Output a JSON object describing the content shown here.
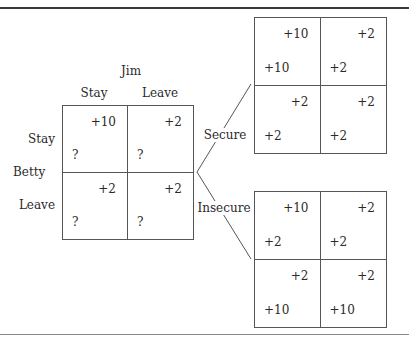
{
  "diagram": {
    "type": "game-matrix-branching",
    "base_game": {
      "column_player": "Jim",
      "row_player": "Betty",
      "column_strategies": [
        "Stay",
        "Leave"
      ],
      "row_strategies": [
        "Stay",
        "Leave"
      ],
      "cells": [
        [
          {
            "col_payoff": "+10",
            "row_payoff": "?"
          },
          {
            "col_payoff": "+2",
            "row_payoff": "?"
          }
        ],
        [
          {
            "col_payoff": "+2",
            "row_payoff": "?"
          },
          {
            "col_payoff": "+2",
            "row_payoff": "?"
          }
        ]
      ]
    },
    "branches": [
      {
        "label": "Secure",
        "cells": [
          [
            {
              "col_payoff": "+10",
              "row_payoff": "+10"
            },
            {
              "col_payoff": "+2",
              "row_payoff": "+2"
            }
          ],
          [
            {
              "col_payoff": "+2",
              "row_payoff": "+2"
            },
            {
              "col_payoff": "+2",
              "row_payoff": "+2"
            }
          ]
        ]
      },
      {
        "label": "Insecure",
        "cells": [
          [
            {
              "col_payoff": "+10",
              "row_payoff": "+2"
            },
            {
              "col_payoff": "+2",
              "row_payoff": "+2"
            }
          ],
          [
            {
              "col_payoff": "+2",
              "row_payoff": "+10"
            },
            {
              "col_payoff": "+2",
              "row_payoff": "+10"
            }
          ]
        ]
      }
    ],
    "colors": {
      "line": "#555555",
      "text": "#2a2a2a",
      "rule_top": "#3a3a3a",
      "rule_bottom": "#8a8a8a"
    }
  }
}
